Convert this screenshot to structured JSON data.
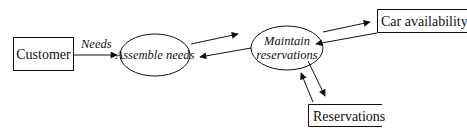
{
  "diagram": {
    "type": "data-flow-diagram",
    "external_entities": [
      {
        "id": "customer",
        "label": "Customer"
      },
      {
        "id": "car_availability",
        "label": "Car availability"
      },
      {
        "id": "reservations_store",
        "label": "Reservations"
      }
    ],
    "processes": [
      {
        "id": "assemble_needs",
        "label": "Assemble needs"
      },
      {
        "id": "maintain_reservations",
        "label_line1": "Maintain",
        "label_line2": "reservations"
      }
    ],
    "flows": [
      {
        "from": "customer",
        "to": "assemble_needs",
        "label": "Needs"
      },
      {
        "from": "assemble_needs",
        "to": "maintain_reservations",
        "label": ""
      },
      {
        "from": "maintain_reservations",
        "to": "assemble_needs",
        "label": ""
      },
      {
        "from": "maintain_reservations",
        "to": "car_availability",
        "label": ""
      },
      {
        "from": "car_availability",
        "to": "maintain_reservations",
        "label": ""
      },
      {
        "from": "maintain_reservations",
        "to": "reservations_store",
        "label": ""
      },
      {
        "from": "reservations_store",
        "to": "maintain_reservations",
        "label": ""
      }
    ]
  }
}
